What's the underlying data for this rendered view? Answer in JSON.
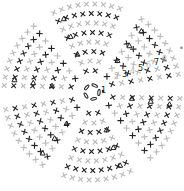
{
  "diagram": {
    "type": "crochet-chart",
    "center": [
      92,
      92
    ],
    "colors": {
      "dark": "#222222",
      "light": "#b8b8b8",
      "background": "#ffffff"
    },
    "wedges": 6,
    "rows": 8,
    "row_labels": [
      {
        "text": "1",
        "x": 101,
        "y": 87,
        "color": "#222222"
      },
      {
        "text": "2",
        "x": 114,
        "y": 73,
        "color": "#b8b8b8"
      },
      {
        "text": "3",
        "x": 122,
        "y": 71,
        "color": "#222222"
      },
      {
        "text": "4",
        "x": 130,
        "y": 68,
        "color": "#b8b8b8"
      },
      {
        "text": "5",
        "x": 138,
        "y": 65,
        "color": "#222222"
      },
      {
        "text": "6",
        "x": 146,
        "y": 62,
        "color": "#b8b8b8"
      },
      {
        "text": "7",
        "x": 154,
        "y": 59,
        "color": "#222222"
      },
      {
        "text": "8",
        "x": 162,
        "y": 56,
        "color": "#b8b8b8"
      }
    ],
    "end_marker": {
      "symbol": "•",
      "x": 179,
      "y": 45
    },
    "center_symbols": "chain-ring (ovals)"
  }
}
